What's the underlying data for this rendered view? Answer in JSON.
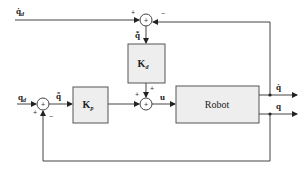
{
  "diagram": {
    "type": "block-diagram",
    "title": "",
    "colors": {
      "line": "#444444",
      "box_fill": "#eeeeee",
      "box_stroke": "#555555",
      "background": "#ffffff"
    },
    "inputs": {
      "qd_dot": "q̇",
      "qd_dot_sub": "d",
      "qd": "q",
      "qd_sub": "d"
    },
    "blocks": {
      "kd": {
        "label": "K",
        "sub": "d"
      },
      "kp": {
        "label": "K",
        "sub": "p"
      },
      "robot": {
        "label": "Robot"
      }
    },
    "signals": {
      "qdot_error": "q̃̇",
      "q_error": "q̃",
      "u": "u",
      "q_dot_out": "q̇",
      "q_out": "q"
    },
    "summing_junctions": [
      {
        "id": "sum-velocity",
        "symbol": "+",
        "signs": {
          "left": "+",
          "right": "−"
        }
      },
      {
        "id": "sum-position",
        "symbol": "+",
        "signs": {
          "left": "+",
          "bottom": "−"
        }
      },
      {
        "id": "sum-control",
        "symbol": "+",
        "signs": {
          "left": "+",
          "top": "+"
        }
      }
    ]
  }
}
